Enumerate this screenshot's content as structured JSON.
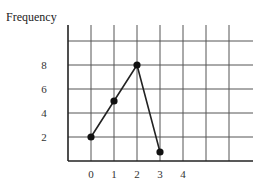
{
  "chart_data": {
    "type": "line",
    "title": "",
    "xlabel": "",
    "ylabel": "Frequency",
    "x": [
      0,
      1,
      2,
      3
    ],
    "values": [
      2,
      5,
      8,
      0.75
    ],
    "x_ticks": [
      "0",
      "1",
      "2",
      "3",
      "4"
    ],
    "y_ticks": [
      "2",
      "4",
      "6",
      "8"
    ],
    "xlim": [
      -1,
      6
    ],
    "ylim": [
      0,
      11
    ],
    "grid": true,
    "legend": null,
    "markers": "filled-circle",
    "line_color": "#222222",
    "grid_color": "#555555"
  }
}
